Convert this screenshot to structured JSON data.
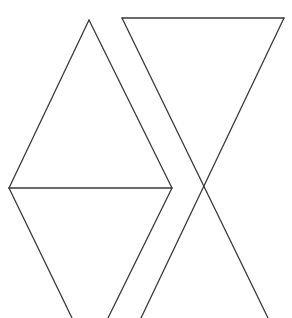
{
  "canvas": {
    "width": 292,
    "height": 318,
    "background": "#ffffff"
  },
  "stroke": {
    "color": "#3a3a3a",
    "width": 1.3
  },
  "shapes": [
    {
      "name": "upper-left-triangle",
      "points": [
        [
          89,
          20
        ],
        [
          9,
          188
        ],
        [
          172,
          188
        ]
      ]
    },
    {
      "name": "lower-left-inverted-triangle",
      "points": [
        [
          9,
          188
        ],
        [
          172,
          188
        ],
        [
          90,
          350
        ]
      ]
    },
    {
      "name": "top-right-inverted-triangle",
      "points": [
        [
          122,
          18
        ],
        [
          284,
          18
        ],
        [
          204,
          188
        ]
      ]
    },
    {
      "name": "bottom-right-triangle",
      "points": [
        [
          204,
          188
        ],
        [
          141,
          318
        ],
        [
          268,
          318
        ]
      ]
    }
  ],
  "lines": [
    {
      "name": "left-tri-left-edge",
      "x1": 89,
      "y1": 20,
      "x2": 9,
      "y2": 188
    },
    {
      "name": "left-tri-right-edge",
      "x1": 89,
      "y1": 20,
      "x2": 172,
      "y2": 188
    },
    {
      "name": "left-tri-base",
      "x1": 9,
      "y1": 188,
      "x2": 172,
      "y2": 188
    },
    {
      "name": "lower-left-edge",
      "x1": 9,
      "y1": 188,
      "x2": 72,
      "y2": 318
    },
    {
      "name": "lower-right-edge",
      "x1": 172,
      "y1": 188,
      "x2": 108,
      "y2": 318
    },
    {
      "name": "inv-tri-top",
      "x1": 122,
      "y1": 18,
      "x2": 284,
      "y2": 18
    },
    {
      "name": "inv-tri-left-diag",
      "x1": 122,
      "y1": 18,
      "x2": 268,
      "y2": 318
    },
    {
      "name": "inv-tri-right-diag",
      "x1": 284,
      "y1": 18,
      "x2": 141,
      "y2": 318
    }
  ]
}
